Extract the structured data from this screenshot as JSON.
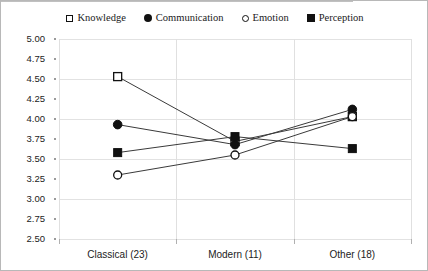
{
  "chart_data": {
    "type": "line",
    "title": "",
    "xlabel": "",
    "ylabel": "",
    "categories": [
      "Classical (23)",
      "Modern (11)",
      "Other (18)"
    ],
    "ylim": [
      2.5,
      5.0
    ],
    "ytick_step": 0.25,
    "yticks": [
      "5.00",
      "4.75",
      "4.50",
      "4.25",
      "4.00",
      "3.75",
      "3.50",
      "3.25",
      "3.00",
      "2.75",
      "2.50"
    ],
    "gridlines_at": [
      5.0,
      4.5,
      4.0,
      3.5,
      3.0,
      2.5
    ],
    "grid": true,
    "legend_position": "top",
    "series": [
      {
        "name": "Knowledge",
        "marker": "square-open",
        "values": [
          4.53,
          3.72,
          4.03
        ]
      },
      {
        "name": "Communication",
        "marker": "circle-filled",
        "values": [
          3.93,
          3.68,
          4.12
        ]
      },
      {
        "name": "Emotion",
        "marker": "circle-open",
        "values": [
          3.3,
          3.55,
          4.03
        ]
      },
      {
        "name": "Perception",
        "marker": "square-filled",
        "values": [
          3.58,
          3.78,
          3.63
        ]
      }
    ]
  },
  "legend": {
    "items": [
      {
        "label": "Knowledge",
        "marker": "square-open"
      },
      {
        "label": "Communication",
        "marker": "circle-filled"
      },
      {
        "label": "Emotion",
        "marker": "circle-open"
      },
      {
        "label": "Perception",
        "marker": "square-filled"
      }
    ]
  },
  "axes": {
    "y_labels": [
      "5.00",
      "4.75",
      "4.50",
      "4.25",
      "4.00",
      "3.75",
      "3.50",
      "3.25",
      "3.00",
      "2.75",
      "2.50"
    ],
    "x_labels": [
      "Classical (23)",
      "Modern (11)",
      "Other (18)"
    ]
  },
  "colors": {
    "marker": "#111111",
    "line": "#3a3a3a",
    "grid": "#e2e2e2",
    "border": "#b8b8b8",
    "background": "#ffffff"
  }
}
